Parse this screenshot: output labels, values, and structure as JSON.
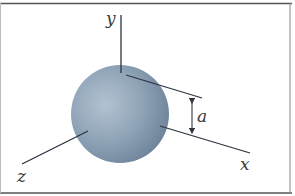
{
  "figure": {
    "labels": {
      "y_axis": "y",
      "x_axis": "x",
      "z_axis": "z",
      "dimension": "a"
    },
    "colors": {
      "frame": "#555555",
      "axis": "#2e3440",
      "sphere_highlight": "#b3c2d1",
      "sphere_mid": "#8fa3b7",
      "sphere_edge": "#6c8298",
      "label": "#3a3a3a"
    }
  }
}
